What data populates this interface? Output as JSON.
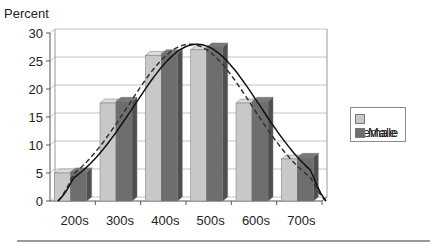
{
  "chart_data": {
    "type": "bar",
    "title": "",
    "xlabel": "",
    "ylabel": "Percent",
    "ylim": [
      0,
      30
    ],
    "yticks": [
      0,
      5,
      10,
      15,
      20,
      25,
      30
    ],
    "grid": true,
    "style": "3d clustered columns with overlaid fitted curves",
    "categories": [
      "200s",
      "300s",
      "400s",
      "500s",
      "600s",
      "700s"
    ],
    "series": [
      {
        "name": "Female",
        "values": [
          5.0,
          17.5,
          26.0,
          27.0,
          17.5,
          7.5
        ],
        "color": "#c8c8c8"
      },
      {
        "name": "Male",
        "values": [
          5.2,
          17.8,
          26.3,
          27.5,
          17.8,
          7.8
        ],
        "color": "#6e6e6e"
      }
    ],
    "curves": [
      {
        "name": "Female fit",
        "style": "dashed",
        "peak": 28
      },
      {
        "name": "Male fit",
        "style": "solid",
        "peak": 28
      }
    ],
    "legend": {
      "position": "right",
      "entries": [
        "Female",
        "Male"
      ]
    }
  },
  "ylabel": "Percent",
  "legend": {
    "female_label": "Female",
    "male_label": "Male"
  }
}
